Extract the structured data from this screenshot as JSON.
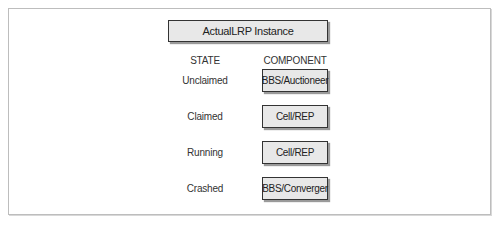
{
  "diagram": {
    "title": "ActualLRP Instance",
    "headers": {
      "state": "STATE",
      "component": "COMPONENT"
    },
    "rows": [
      {
        "state": "Unclaimed",
        "component": "BBS/Auctioneer"
      },
      {
        "state": "Claimed",
        "component": "Cell/REP"
      },
      {
        "state": "Running",
        "component": "Cell/REP"
      },
      {
        "state": "Crashed",
        "component": "BBS/Converger"
      }
    ],
    "colors": {
      "box_fill": "#e8e8e8",
      "box_border": "#333333",
      "frame_border": "#bdbdbd"
    }
  }
}
